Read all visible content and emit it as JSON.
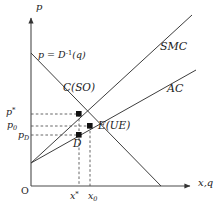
{
  "figure": {
    "background_color": "#ffffff",
    "line_color": "#3d3d3d",
    "marker_color": "#111111",
    "dash_color": "#555555",
    "width": 219,
    "height": 216
  },
  "axes": {
    "vertical_label": "p",
    "horizontal_label": "x,q",
    "origin_label": "O",
    "origin_px": {
      "x": 31,
      "y": 186
    },
    "x_axis_end_px": {
      "x": 196,
      "y": 186
    },
    "y_axis_top_px": {
      "x": 31,
      "y": 14
    }
  },
  "curves": [
    {
      "name": "SMC",
      "label": "SMC",
      "label_px": {
        "x": 160,
        "y": 47
      },
      "kind": "line",
      "from_px": {
        "x": 31,
        "y": 163
      },
      "to_px": {
        "x": 192,
        "y": 15
      }
    },
    {
      "name": "AC",
      "label": "AC",
      "label_px": {
        "x": 167,
        "y": 89
      },
      "kind": "line",
      "from_px": {
        "x": 31,
        "y": 163
      },
      "to_px": {
        "x": 196,
        "y": 70
      }
    },
    {
      "name": "inverse-demand",
      "label_prefix": "p = D",
      "label_exponent": "-1",
      "label_suffix": "(q)",
      "label_px": {
        "x": 38,
        "y": 56
      },
      "kind": "line",
      "from_px": {
        "x": 31,
        "y": 53
      },
      "to_px": {
        "x": 161,
        "y": 186
      }
    }
  ],
  "points": [
    {
      "name": "C",
      "label": "C(SO)",
      "label_px": {
        "x": 63,
        "y": 88
      },
      "px": {
        "x": 79,
        "y": 114
      },
      "description": "second-best / social optimum point"
    },
    {
      "name": "E",
      "label": "E(UE)",
      "label_px": {
        "x": 98,
        "y": 121
      },
      "px": {
        "x": 90,
        "y": 126
      },
      "description": "unregulated equilibrium point"
    },
    {
      "name": "D",
      "label": "D",
      "label_px": {
        "x": 73,
        "y": 138
      },
      "px": {
        "x": 79,
        "y": 135
      },
      "description": "point on AC at quantity x*"
    }
  ],
  "y_ticks": [
    {
      "name": "p-star",
      "label": "p",
      "sup": "*",
      "y_px": 114,
      "label_px": {
        "x": 5,
        "y": 108
      }
    },
    {
      "name": "p-zero",
      "label": "p",
      "sub": "0",
      "y_px": 126,
      "label_px": {
        "x": 5,
        "y": 120
      }
    },
    {
      "name": "p-D",
      "label": "p",
      "sub": "D",
      "y_px": 135,
      "label_px": {
        "x": 17,
        "y": 132
      }
    }
  ],
  "x_ticks": [
    {
      "name": "x-star",
      "label": "x",
      "sup": "*",
      "x_px": 79,
      "label_px": {
        "x": 70,
        "y": 192
      }
    },
    {
      "name": "x-zero",
      "label": "x",
      "sub": "0",
      "x_px": 90,
      "label_px": {
        "x": 88,
        "y": 192
      }
    }
  ],
  "dashed_guides": {
    "horizontal": [
      {
        "name": "guide-p-star",
        "y_px": 114,
        "from_x": 31,
        "to_x": 79
      },
      {
        "name": "guide-p-zero",
        "y_px": 126,
        "from_x": 31,
        "to_x": 90
      },
      {
        "name": "guide-p-D",
        "y_px": 135,
        "from_x": 31,
        "to_x": 79
      }
    ],
    "vertical": [
      {
        "name": "guide-x-star",
        "x_px": 79,
        "from_y": 114,
        "to_y": 186
      },
      {
        "name": "guide-x-zero",
        "x_px": 90,
        "from_y": 126,
        "to_y": 186
      }
    ]
  }
}
